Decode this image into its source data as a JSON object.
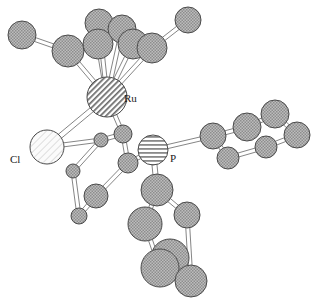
{
  "figure": {
    "type": "ball-and-stick-molecular-structure",
    "background": "#ffffff",
    "width": 322,
    "height": 305
  },
  "styles": {
    "fill_carbon": "#a8a8a8",
    "fill_metal": "#c8c8c8",
    "fill_phosphorus": "#b0b0b0",
    "fill_chlorine": "#f0f0f0",
    "stroke": "#4a4a4a",
    "bond_fill": "#ffffff",
    "bond_stroke": "#777777",
    "label_color": "#1a1a1a"
  },
  "labels": [
    {
      "id": "label-ru",
      "text": "Ru",
      "x": 124,
      "y": 102
    },
    {
      "id": "label-cl",
      "text": "Cl",
      "x": 10,
      "y": 163
    },
    {
      "id": "label-p",
      "text": "P",
      "x": 170,
      "y": 162
    }
  ],
  "atoms": [
    {
      "id": "Ru",
      "element": "Ru",
      "label": "Ru",
      "x": 107,
      "y": 97,
      "r": 20,
      "pattern": "diagonal-hatch"
    },
    {
      "id": "Cl",
      "element": "Cl",
      "label": "Cl",
      "x": 47,
      "y": 147,
      "r": 17,
      "pattern": "light-hatch"
    },
    {
      "id": "P",
      "element": "P",
      "label": "P",
      "x": 153,
      "y": 150,
      "r": 15,
      "pattern": "horizontal-hatch"
    },
    {
      "id": "C1",
      "element": "C",
      "label": "",
      "x": 68,
      "y": 51,
      "r": 16,
      "pattern": "checker"
    },
    {
      "id": "C2",
      "element": "C",
      "label": "",
      "x": 98,
      "y": 44,
      "r": 15,
      "pattern": "checker"
    },
    {
      "id": "C3",
      "element": "C",
      "label": "",
      "x": 133,
      "y": 44,
      "r": 15,
      "pattern": "checker"
    },
    {
      "id": "C4",
      "element": "C",
      "label": "",
      "x": 152,
      "y": 48,
      "r": 15,
      "pattern": "checker"
    },
    {
      "id": "C5",
      "element": "C",
      "label": "",
      "x": 122,
      "y": 29,
      "r": 14,
      "pattern": "checker"
    },
    {
      "id": "C6",
      "element": "C",
      "label": "",
      "x": 99,
      "y": 23,
      "r": 14,
      "pattern": "checker"
    },
    {
      "id": "C7",
      "element": "C",
      "label": "",
      "x": 22,
      "y": 35,
      "r": 14,
      "pattern": "checker"
    },
    {
      "id": "C8",
      "element": "C",
      "label": "",
      "x": 188,
      "y": 20,
      "r": 13,
      "pattern": "checker"
    },
    {
      "id": "C9",
      "element": "C",
      "label": "",
      "x": 101,
      "y": 140,
      "r": 7,
      "pattern": "checker"
    },
    {
      "id": "C10",
      "element": "C",
      "label": "",
      "x": 123,
      "y": 134,
      "r": 9,
      "pattern": "checker"
    },
    {
      "id": "C11",
      "element": "C",
      "label": "",
      "x": 128,
      "y": 163,
      "r": 10,
      "pattern": "checker"
    },
    {
      "id": "C12",
      "element": "C",
      "label": "",
      "x": 73,
      "y": 171,
      "r": 7,
      "pattern": "checker"
    },
    {
      "id": "C13",
      "element": "C",
      "label": "",
      "x": 96,
      "y": 196,
      "r": 12,
      "pattern": "checker"
    },
    {
      "id": "C14",
      "element": "C",
      "label": "",
      "x": 79,
      "y": 216,
      "r": 8,
      "pattern": "checker"
    },
    {
      "id": "C15",
      "element": "C",
      "label": "",
      "x": 213,
      "y": 136,
      "r": 13,
      "pattern": "checker"
    },
    {
      "id": "C16",
      "element": "C",
      "label": "",
      "x": 247,
      "y": 127,
      "r": 14,
      "pattern": "checker"
    },
    {
      "id": "C17",
      "element": "C",
      "label": "",
      "x": 275,
      "y": 114,
      "r": 14,
      "pattern": "checker"
    },
    {
      "id": "C18",
      "element": "C",
      "label": "",
      "x": 297,
      "y": 135,
      "r": 13,
      "pattern": "checker"
    },
    {
      "id": "C19",
      "element": "C",
      "label": "",
      "x": 266,
      "y": 147,
      "r": 11,
      "pattern": "checker"
    },
    {
      "id": "C20",
      "element": "C",
      "label": "",
      "x": 228,
      "y": 158,
      "r": 11,
      "pattern": "checker"
    },
    {
      "id": "C21",
      "element": "C",
      "label": "",
      "x": 157,
      "y": 190,
      "r": 16,
      "pattern": "checker"
    },
    {
      "id": "C22",
      "element": "C",
      "label": "",
      "x": 145,
      "y": 224,
      "r": 17,
      "pattern": "checker"
    },
    {
      "id": "C23",
      "element": "C",
      "label": "",
      "x": 187,
      "y": 215,
      "r": 13,
      "pattern": "checker"
    },
    {
      "id": "C24",
      "element": "C",
      "label": "",
      "x": 170,
      "y": 258,
      "r": 19,
      "pattern": "checker"
    },
    {
      "id": "C25",
      "element": "C",
      "label": "",
      "x": 160,
      "y": 268,
      "r": 19,
      "pattern": "checker"
    },
    {
      "id": "C26",
      "element": "C",
      "label": "",
      "x": 191,
      "y": 281,
      "r": 16,
      "pattern": "checker"
    }
  ],
  "bonds": [
    {
      "from": "Ru",
      "to": "C1",
      "width": 4
    },
    {
      "from": "Ru",
      "to": "C2",
      "width": 4
    },
    {
      "from": "Ru",
      "to": "C3",
      "width": 4
    },
    {
      "from": "Ru",
      "to": "C4",
      "width": 4
    },
    {
      "from": "Ru",
      "to": "C5",
      "width": 4
    },
    {
      "from": "Ru",
      "to": "C6",
      "width": 4
    },
    {
      "from": "Ru",
      "to": "Cl",
      "width": 5
    },
    {
      "from": "Ru",
      "to": "C10",
      "width": 4
    },
    {
      "from": "C1",
      "to": "C7",
      "width": 4
    },
    {
      "from": "C4",
      "to": "C8",
      "width": 4
    },
    {
      "from": "C2",
      "to": "C6",
      "width": 4
    },
    {
      "from": "C5",
      "to": "C3",
      "width": 4
    },
    {
      "from": "C1",
      "to": "C2",
      "width": 4
    },
    {
      "from": "C3",
      "to": "C4",
      "width": 4
    },
    {
      "from": "C5",
      "to": "C6",
      "width": 4
    },
    {
      "from": "Cl",
      "to": "C9",
      "width": 4
    },
    {
      "from": "C9",
      "to": "C10",
      "width": 4
    },
    {
      "from": "C9",
      "to": "C12",
      "width": 4
    },
    {
      "from": "C10",
      "to": "C11",
      "width": 4
    },
    {
      "from": "C11",
      "to": "P",
      "width": 4
    },
    {
      "from": "C12",
      "to": "C14",
      "width": 4
    },
    {
      "from": "C13",
      "to": "C14",
      "width": 4
    },
    {
      "from": "C13",
      "to": "C11",
      "width": 4
    },
    {
      "from": "P",
      "to": "C15",
      "width": 4
    },
    {
      "from": "P",
      "to": "C21",
      "width": 5
    },
    {
      "from": "C15",
      "to": "C16",
      "width": 4
    },
    {
      "from": "C16",
      "to": "C17",
      "width": 4
    },
    {
      "from": "C17",
      "to": "C18",
      "width": 4
    },
    {
      "from": "C18",
      "to": "C19",
      "width": 4
    },
    {
      "from": "C19",
      "to": "C20",
      "width": 4
    },
    {
      "from": "C20",
      "to": "C15",
      "width": 4
    },
    {
      "from": "C21",
      "to": "C22",
      "width": 4
    },
    {
      "from": "C21",
      "to": "C23",
      "width": 4
    },
    {
      "from": "C22",
      "to": "C25",
      "width": 4
    },
    {
      "from": "C23",
      "to": "C26",
      "width": 4
    },
    {
      "from": "C24",
      "to": "C26",
      "width": 4
    }
  ]
}
